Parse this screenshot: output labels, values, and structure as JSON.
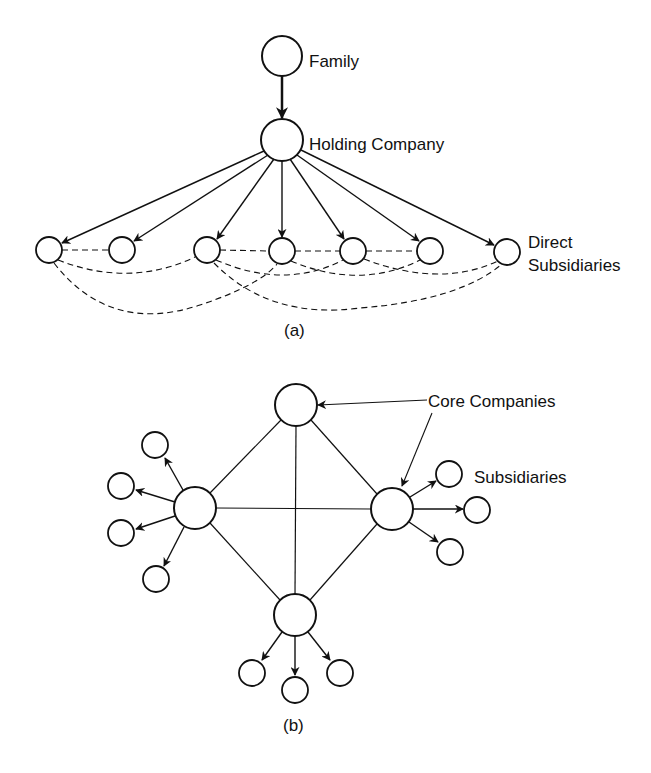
{
  "diagram_a": {
    "caption": "(a)",
    "labels": {
      "family": "Family",
      "holding": "Holding Company",
      "direct_line1": "Direct",
      "direct_line2": "Subsidiaries"
    },
    "nodes": {
      "family": {
        "x": 282,
        "y": 56,
        "r": 20
      },
      "holding": {
        "x": 282,
        "y": 140,
        "r": 21
      },
      "subsidiaries": [
        {
          "x": 49,
          "y": 250,
          "r": 13
        },
        {
          "x": 122,
          "y": 250,
          "r": 13
        },
        {
          "x": 207,
          "y": 250,
          "r": 13
        },
        {
          "x": 282,
          "y": 251,
          "r": 13
        },
        {
          "x": 353,
          "y": 251,
          "r": 13
        },
        {
          "x": 430,
          "y": 251,
          "r": 13
        },
        {
          "x": 507,
          "y": 252,
          "r": 13
        }
      ]
    }
  },
  "diagram_b": {
    "caption": "(b)",
    "labels": {
      "core": "Core Companies",
      "subsidiaries": "Subsidiaries"
    },
    "cores": {
      "top": {
        "x": 296,
        "y": 405,
        "r": 21
      },
      "left": {
        "x": 195,
        "y": 508,
        "r": 21
      },
      "right": {
        "x": 392,
        "y": 509,
        "r": 21
      },
      "bottom": {
        "x": 295,
        "y": 615,
        "r": 21
      }
    }
  }
}
